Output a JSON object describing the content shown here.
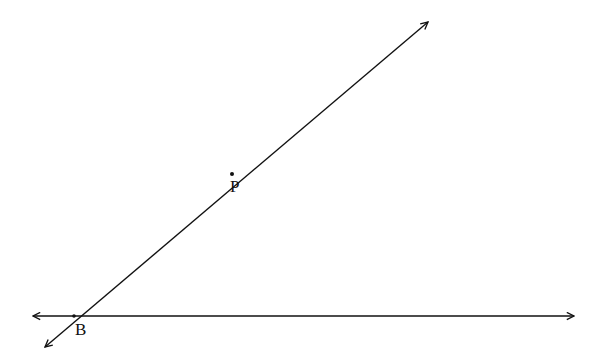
{
  "diagram": {
    "title": "",
    "points": [
      {
        "id": "B",
        "label": "B",
        "x": 74,
        "y": 316
      },
      {
        "id": "P",
        "label": "P",
        "x": 232,
        "y": 174
      }
    ],
    "lines": [
      {
        "id": "horizontal-line",
        "from": [
          33,
          316
        ],
        "to": [
          574,
          316
        ],
        "arrow_start": true,
        "arrow_end": true
      },
      {
        "id": "slanted-line-BP",
        "from": [
          45,
          347
        ],
        "to": [
          428,
          22
        ],
        "arrow_start": true,
        "arrow_end": true
      }
    ],
    "colors": {
      "stroke": "#111111",
      "background": "#ffffff"
    }
  }
}
